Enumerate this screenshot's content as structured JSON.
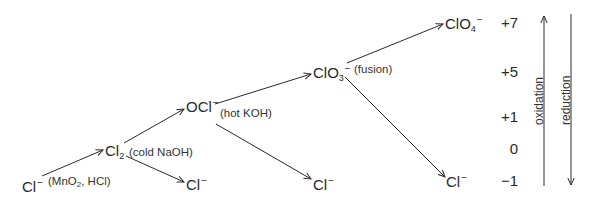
{
  "diagram": {
    "species": {
      "cl_minus_start": {
        "base": "Cl",
        "sub": "",
        "charge": "−"
      },
      "cl2": {
        "base": "Cl",
        "sub": "2",
        "charge": ""
      },
      "ocl_minus": {
        "base": "OCl",
        "sub": "",
        "charge": "−"
      },
      "clo3_minus": {
        "base": "ClO",
        "sub": "3",
        "charge": "−"
      },
      "clo4_minus": {
        "base": "ClO",
        "sub": "4",
        "charge": "−"
      },
      "cl_minus_from_cl2": {
        "base": "Cl",
        "sub": "",
        "charge": "−"
      },
      "cl_minus_from_ocl": {
        "base": "Cl",
        "sub": "",
        "charge": "−"
      },
      "cl_minus_from_clo3": {
        "base": "Cl",
        "sub": "",
        "charge": "−"
      }
    },
    "conditions": {
      "mno2_hcl": {
        "pre": "(MnO",
        "sub": "2",
        "post": ", HCl)"
      },
      "cold_naoh": "(cold NaOH)",
      "hot_koh": "(hot KOH)",
      "fusion": "(fusion)"
    },
    "oxidation_states": [
      "+7",
      "+5",
      "+1",
      "0",
      "−1"
    ],
    "axis_labels": {
      "oxidation": "oxidation",
      "reduction": "reduction"
    },
    "edges": [
      {
        "from": "Cl−",
        "to": "Cl2",
        "condition": "(MnO2, HCl)"
      },
      {
        "from": "Cl2",
        "to": "OCl−",
        "condition": "(cold NaOH)"
      },
      {
        "from": "Cl2",
        "to": "Cl−",
        "condition": "(cold NaOH)"
      },
      {
        "from": "OCl−",
        "to": "ClO3−",
        "condition": "(hot KOH)"
      },
      {
        "from": "OCl−",
        "to": "Cl−",
        "condition": "(hot KOH)"
      },
      {
        "from": "ClO3−",
        "to": "ClO4−",
        "condition": "(fusion)"
      },
      {
        "from": "ClO3−",
        "to": "Cl−",
        "condition": "(fusion)"
      }
    ],
    "colors": {
      "ink": "#2a2a2a",
      "background": "#ffffff"
    }
  }
}
